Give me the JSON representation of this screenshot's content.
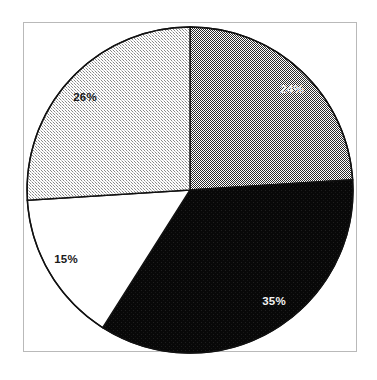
{
  "figure": {
    "name": "pie-chart-figure",
    "background_color": "#ffffff",
    "frame": {
      "border_color": "#b9b9b9",
      "fill_color": "#ffffff"
    }
  },
  "chart_data": {
    "type": "pie",
    "title": "",
    "subtitle": "",
    "xlabel": "",
    "ylabel": "",
    "grid": false,
    "legend": false,
    "legend_position": "none",
    "start_angle_deg": 90,
    "direction": "clockwise",
    "total_percent": 100,
    "categories": [
      "Segment 1",
      "Segment 2",
      "Segment 3",
      "Segment 4"
    ],
    "values": [
      24,
      35,
      15,
      26
    ],
    "labels": [
      "24%",
      "35%",
      "15%",
      "26%"
    ],
    "slices": [
      {
        "label": "24%",
        "value": 24,
        "fill": "#808080",
        "fill_style": "dither-50",
        "text_color": "#f2f2f2",
        "label_x": 292,
        "label_y": 93,
        "start_deg": 0,
        "end_deg": 86.4
      },
      {
        "label": "35%",
        "value": 35,
        "fill": "#0a0a0a",
        "fill_style": "solid-black",
        "text_color": "#f2f2f2",
        "label_x": 274,
        "label_y": 305,
        "start_deg": 86.4,
        "end_deg": 212.4
      },
      {
        "label": "15%",
        "value": 15,
        "fill": "#ffffff",
        "fill_style": "solid-white",
        "text_color": "#1a1a1a",
        "label_x": 66,
        "label_y": 263,
        "start_deg": 212.4,
        "end_deg": 266.4
      },
      {
        "label": "26%",
        "value": 26,
        "fill": "#d9d9d9",
        "fill_style": "dither-25",
        "text_color": "#1a1a1a",
        "label_x": 85,
        "label_y": 101,
        "start_deg": 266.4,
        "end_deg": 360
      }
    ],
    "geometry": {
      "center_x": 190,
      "center_y": 190,
      "radius": 163,
      "outline_color": "#111111",
      "outline_width": 1.4
    }
  }
}
